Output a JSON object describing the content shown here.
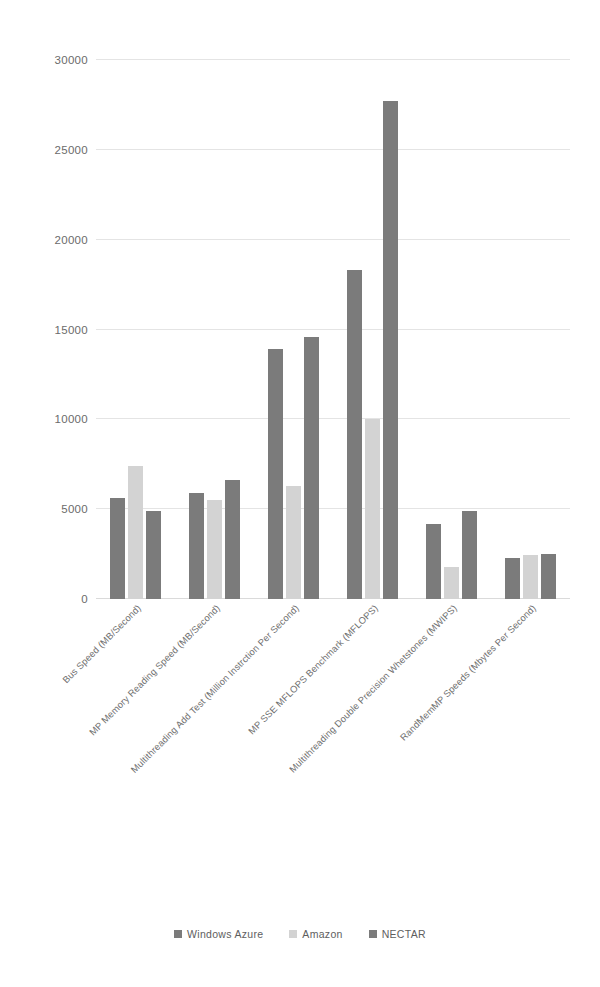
{
  "chart_data": {
    "type": "bar",
    "title": "",
    "subtitle": "",
    "xlabel": "",
    "ylabel": "",
    "ylim": [
      0,
      30000
    ],
    "ytick_labels": [
      "0",
      "5000",
      "10000",
      "15000",
      "20000",
      "25000",
      "30000"
    ],
    "ytick_values": [
      0,
      5000,
      10000,
      15000,
      20000,
      25000,
      30000
    ],
    "grid": true,
    "legend_position": "bottom-center",
    "categories": [
      "Bus Speed (MB/Second)",
      "MP Memory Reading Speed (MB/Second)",
      "Multithreading Add Test (Million Instrction Per Second)",
      "MP SSE MFLOPS Benchmark (MFLOPS)",
      "Multithreading Double Precision Whetstones (MWIPS)",
      "RandMemMP Speeds (Mbytes Per Second)"
    ],
    "series": [
      {
        "name": "Windows Azure",
        "color": "#7b7b7b",
        "values": [
          5600,
          5900,
          13900,
          18300,
          4200,
          2300
        ]
      },
      {
        "name": "Amazon",
        "color": "#d3d3d3",
        "values": [
          7400,
          5500,
          6300,
          10000,
          1800,
          2450
        ]
      },
      {
        "name": "NECTAR",
        "color": "#7b7b7b",
        "values": [
          4900,
          6650,
          14600,
          27700,
          4900,
          2500
        ]
      }
    ]
  },
  "legend": {
    "items": [
      {
        "label": "Windows Azure",
        "color": "#7b7b7b"
      },
      {
        "label": "Amazon",
        "color": "#d3d3d3"
      },
      {
        "label": "NECTAR",
        "color": "#7b7b7b"
      }
    ]
  },
  "colors": {
    "gridline": "#e4e4e4",
    "tick_text": "#6b6b6b",
    "category_text": "#6e6e6e",
    "background": "#ffffff"
  }
}
